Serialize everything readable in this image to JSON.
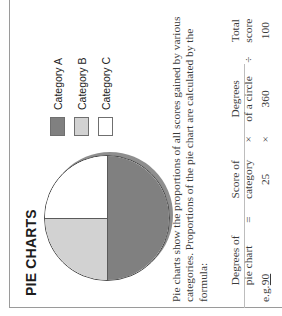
{
  "document": {
    "title": "PIE CHARTS",
    "orientation": "rotated-90-ccw"
  },
  "body": {
    "paragraph_line_1": "Pie charts show the proportions of all scores gained by various",
    "paragraph_line_2": "categories. Proportions of the pie chart are calculated by the",
    "paragraph_line_3": "formula:"
  },
  "formula_table": {
    "header": {
      "term1": "Degrees of\npie chart",
      "op_equals": "=",
      "term2": "Score of\ncategory",
      "op_multiply": "×",
      "term3": "Degrees\nof a circle",
      "op_divide": "÷",
      "term4": "Total\nscore"
    },
    "example": {
      "label": "e.g.",
      "term1": "90",
      "op_equals": "",
      "term2": "25",
      "op_multiply": "×",
      "term3": "360",
      "op_divide": "",
      "term4": "100"
    }
  },
  "legend": {
    "items": [
      {
        "label": "Category A",
        "color": "#808080"
      },
      {
        "label": "Category B",
        "color": "#d2d2d2"
      },
      {
        "label": "Category C",
        "color": "#ffffff"
      }
    ]
  },
  "chart_data": {
    "type": "pie",
    "title": "PIE CHARTS",
    "categories": [
      "Category A",
      "Category B",
      "Category C"
    ],
    "values": [
      50,
      25,
      25
    ],
    "value_unit": "percent",
    "degrees": [
      180,
      90,
      90
    ],
    "colors": [
      "#808080",
      "#d2d2d2",
      "#ffffff"
    ],
    "legend_position": "right",
    "grid": false,
    "start_angle_deg": 90,
    "direction": "clockwise",
    "annotations": [
      "Pie charts show the proportions of all scores gained by various categories.",
      "Degrees of pie chart = Score of category × Degrees of a circle ÷ Total score",
      "e.g. 90 = 25 × 360 ÷ 100"
    ]
  },
  "colors": {
    "category_a": "#808080",
    "category_b": "#d2d2d2",
    "category_c": "#ffffff",
    "outline": "#4a4a4a",
    "rule": "#9a9a9a",
    "page_background": "#ffffff"
  }
}
